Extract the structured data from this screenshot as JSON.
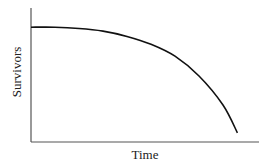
{
  "chart_data": {
    "type": "line",
    "title": "",
    "xlabel": "Time",
    "ylabel": "Survivors",
    "grid": false,
    "legend": null,
    "ticks": {
      "x": [],
      "y": []
    },
    "xlim": [
      0,
      1
    ],
    "ylim": [
      0,
      1
    ],
    "series": [
      {
        "name": "survivorship",
        "x": [
          0,
          0.1,
          0.2,
          0.3,
          0.4,
          0.5,
          0.6,
          0.7,
          0.8,
          0.86
        ],
        "y": [
          0.87,
          0.87,
          0.86,
          0.84,
          0.8,
          0.74,
          0.65,
          0.5,
          0.28,
          0.07
        ]
      }
    ]
  },
  "colors": {
    "axis": "#555555",
    "curve": "#111111",
    "text": "#222222"
  }
}
